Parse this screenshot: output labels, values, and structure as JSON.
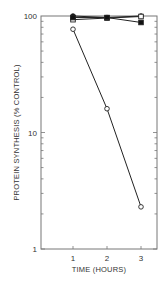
{
  "chart_data": {
    "type": "line",
    "title": "",
    "xlabel": "TIME (HOURS)",
    "ylabel": "PROTEIN SYNTHESIS (% CONTROL)",
    "yscale": "log",
    "ylim": [
      1,
      100
    ],
    "xlim": [
      0,
      3.5
    ],
    "x_ticks": [
      "1",
      "2",
      "3"
    ],
    "y_ticks": [
      "1",
      "10",
      "100"
    ],
    "grid": false,
    "x": [
      1,
      2,
      3
    ],
    "series": [
      {
        "name": "filled circles",
        "marker": "filled-circle",
        "values": [
          100,
          97,
          100
        ]
      },
      {
        "name": "open squares",
        "marker": "open-square",
        "values": [
          93,
          96,
          99
        ]
      },
      {
        "name": "filled squares",
        "marker": "filled-square",
        "values": [
          97,
          97,
          88
        ]
      },
      {
        "name": "open circles",
        "marker": "open-circle",
        "values": [
          77,
          16,
          2.3
        ]
      }
    ]
  }
}
